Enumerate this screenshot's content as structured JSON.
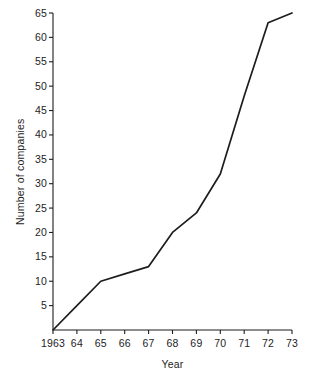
{
  "chart_data": {
    "type": "line",
    "title": "",
    "xlabel": "Year",
    "ylabel": "Number of companies",
    "x": [
      1963,
      1964,
      1965,
      1966,
      1967,
      1968,
      1969,
      1970,
      1971,
      1972,
      1973
    ],
    "xtick_labels": [
      "1963",
      "64",
      "65",
      "66",
      "67",
      "68",
      "69",
      "70",
      "71",
      "72",
      "73"
    ],
    "values": [
      0,
      5,
      10,
      11.5,
      13,
      20,
      24,
      32,
      48,
      63,
      65
    ],
    "ytick_labels": [
      "5",
      "10",
      "15",
      "20",
      "25",
      "30",
      "35",
      "40",
      "45",
      "50",
      "55",
      "60",
      "65"
    ],
    "ytick_values": [
      5,
      10,
      15,
      20,
      25,
      30,
      35,
      40,
      45,
      50,
      55,
      60,
      65
    ],
    "xlim": [
      1963,
      1973
    ],
    "ylim": [
      0,
      65
    ],
    "grid": false,
    "legend": "none",
    "line_color": "#1d1d1d",
    "axis_color": "#1d1d1d",
    "background_color": "#ffffff"
  }
}
